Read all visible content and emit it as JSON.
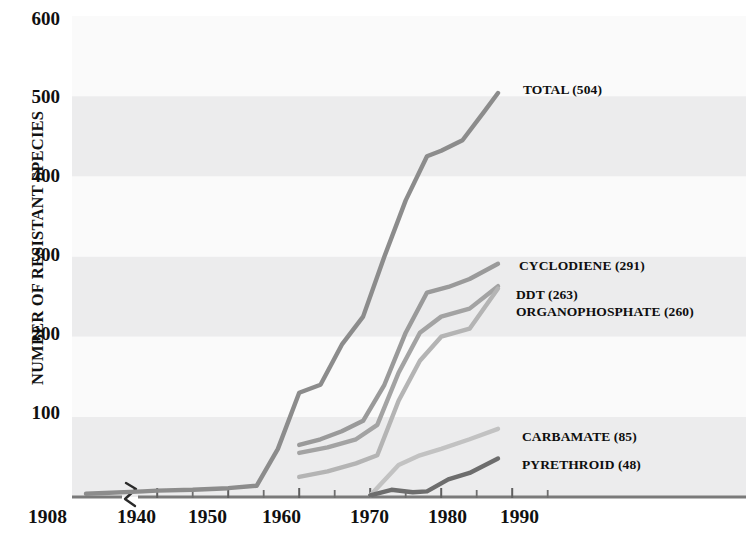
{
  "chart_data": {
    "type": "line",
    "title": "",
    "subtitle": "",
    "xlabel": "",
    "ylabel": "NUMBER OF RESISTANT SPECIES",
    "xlim": [
      1908,
      1998
    ],
    "ylim": [
      0,
      600
    ],
    "grid": false,
    "axis_break": {
      "present": true,
      "between": [
        1908,
        1938
      ],
      "symbol": "zigzag"
    },
    "banding": {
      "present": true,
      "orientation": "horizontal",
      "step": 100,
      "shaded_color": "#ececed",
      "plain_color": "#fafafa"
    },
    "legend": {
      "position": "inline-right-of-line-ends"
    },
    "y_ticks": [
      100,
      200,
      300,
      400,
      500,
      600
    ],
    "x_ticks_major": [
      1908,
      1940,
      1950,
      1960,
      1970,
      1980,
      1990
    ],
    "x_ticks_minor": [
      1945,
      1955,
      1965,
      1975,
      1985,
      1995
    ],
    "series": [
      {
        "name": "TOTAL",
        "label": "TOTAL (504)",
        "final_value": 504,
        "color": "#8c8c8c",
        "x": [
          1908,
          1938,
          1940,
          1945,
          1950,
          1954,
          1957,
          1960,
          1963,
          1966,
          1969,
          1972,
          1975,
          1978,
          1980,
          1983,
          1986,
          1988
        ],
        "y": [
          4,
          7,
          8,
          9,
          11,
          14,
          60,
          130,
          140,
          190,
          225,
          300,
          370,
          425,
          432,
          445,
          480,
          504
        ]
      },
      {
        "name": "CYCLODIENE",
        "label": "CYCLODIENE (291)",
        "final_value": 291,
        "color": "#9a9a9a",
        "x": [
          1960,
          1963,
          1966,
          1969,
          1972,
          1975,
          1978,
          1981,
          1984,
          1988
        ],
        "y": [
          65,
          72,
          82,
          95,
          140,
          205,
          255,
          262,
          272,
          291
        ]
      },
      {
        "name": "DDT",
        "label": "DDT (263)",
        "final_value": 263,
        "color": "#a3a3a3",
        "x": [
          1960,
          1964,
          1968,
          1971,
          1974,
          1977,
          1980,
          1984,
          1988
        ],
        "y": [
          55,
          62,
          72,
          90,
          155,
          205,
          225,
          235,
          263
        ]
      },
      {
        "name": "ORGANOPHOSPHATE",
        "label": "ORGANOPHOSPHATE (260)",
        "final_value": 260,
        "color": "#b4b4b4",
        "x": [
          1960,
          1964,
          1968,
          1971,
          1974,
          1977,
          1980,
          1984,
          1988
        ],
        "y": [
          25,
          32,
          42,
          52,
          120,
          170,
          200,
          210,
          260
        ]
      },
      {
        "name": "CARBAMATE",
        "label": "CARBAMATE (85)",
        "final_value": 85,
        "color": "#c2c2c2",
        "x": [
          1970,
          1974,
          1977,
          1980,
          1984,
          1988
        ],
        "y": [
          2,
          40,
          52,
          60,
          72,
          85
        ]
      },
      {
        "name": "PYRETHROID",
        "label": "PYRETHROID (48)",
        "final_value": 48,
        "color": "#6d6d6d",
        "x": [
          1970,
          1973,
          1976,
          1978,
          1981,
          1984,
          1988
        ],
        "y": [
          2,
          9,
          6,
          7,
          22,
          30,
          48
        ]
      }
    ]
  },
  "axes": {
    "y_title": "NUMBER OF RESISTANT SPECIES",
    "y_tick_labels": [
      "600",
      "500",
      "400",
      "300",
      "200",
      "100"
    ],
    "x_tick_labels": [
      "1908",
      "1940",
      "1950",
      "1960",
      "1970",
      "1980",
      "1990"
    ]
  },
  "series_labels": {
    "total": "TOTAL (504)",
    "cyclodiene": "CYCLODIENE (291)",
    "ddt": "DDT (263)",
    "organophosphate": "ORGANOPHOSPHATE (260)",
    "carbamate": "CARBAMATE (85)",
    "pyrethroid": "PYRETHROID (48)"
  },
  "colors": {
    "total": "#8c8c8c",
    "cyclodiene": "#9a9a9a",
    "ddt": "#a3a3a3",
    "organophosphate": "#b4b4b4",
    "carbamate": "#c2c2c2",
    "pyrethroid": "#6d6d6d",
    "axis": "#7a7a7a",
    "band_shaded": "#ececed",
    "band_plain": "#fafafa",
    "text": "#101010"
  }
}
